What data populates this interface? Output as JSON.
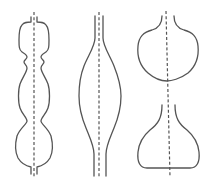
{
  "figure": {
    "colors": {
      "stroke": "#555555",
      "background": "#ffffff"
    },
    "shapes": [
      {
        "id": "left",
        "label": "multi-lobed profile",
        "lobes": 3
      },
      {
        "id": "middle",
        "label": "single spindle bulge",
        "lobes": 1
      },
      {
        "id": "right",
        "label": "split profile: upper bulb and lower flask",
        "lobes": 2
      }
    ]
  }
}
